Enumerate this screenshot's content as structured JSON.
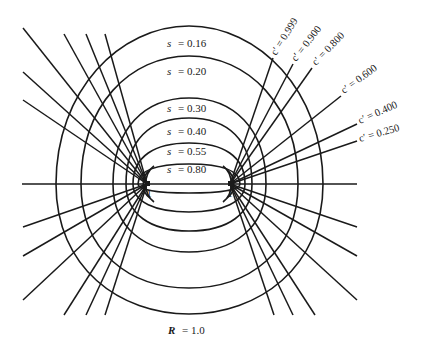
{
  "figure": {
    "caption": "R = 1.0",
    "caption_var": "R",
    "caption_value": "= 1.0",
    "foci": [
      {
        "label": "−1",
        "x": -1
      },
      {
        "label": "1",
        "x": 1
      }
    ],
    "s_curves": [
      {
        "var": "s",
        "value": "= 0.16",
        "s": 0.16
      },
      {
        "var": "s",
        "value": "= 0.20",
        "s": 0.2
      },
      {
        "var": "s",
        "value": "= 0.30",
        "s": 0.3
      },
      {
        "var": "s",
        "value": "= 0.40",
        "s": 0.4
      },
      {
        "var": "s",
        "value": "= 0.55",
        "s": 0.55
      },
      {
        "var": "s",
        "value": "= 0.80",
        "s": 0.8
      }
    ],
    "c_lines": [
      {
        "label": "c′ = 0.999",
        "c": 0.999
      },
      {
        "label": "c′ = 0.900",
        "c": 0.9
      },
      {
        "label": "c′ = 0.800",
        "c": 0.8
      },
      {
        "label": "c′ = 0.600",
        "c": 0.6
      },
      {
        "label": "c′ = 0.400",
        "c": 0.4
      },
      {
        "label": "c′ = 0.250",
        "c": 0.25
      }
    ],
    "colors": {
      "ink": "#1a1a1a",
      "background": "#ffffff"
    }
  }
}
